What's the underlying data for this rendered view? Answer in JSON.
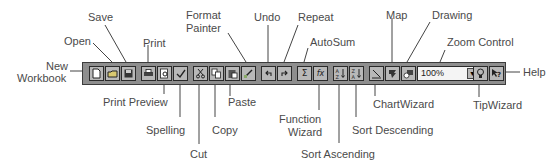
{
  "diagram": {
    "zoom_control": {
      "value": "100%"
    },
    "callouts": {
      "new_workbook": [
        "New",
        "Workbook"
      ],
      "open": "Open",
      "save": "Save",
      "print": "Print",
      "print_preview": "Print Preview",
      "spelling": "Spelling",
      "cut": "Cut",
      "copy": "Copy",
      "paste": "Paste",
      "format_painter": [
        "Format",
        "Painter"
      ],
      "undo": "Undo",
      "repeat": "Repeat",
      "autosum": "AutoSum",
      "function_wizard": [
        "Function",
        "Wizard"
      ],
      "sort_ascending": "Sort Ascending",
      "sort_descending": "Sort Descending",
      "chartwizard": "ChartWizard",
      "map": "Map",
      "drawing": "Drawing",
      "zoom_control": "Zoom Control",
      "tipwizard": "TipWizard",
      "help": "Help"
    },
    "buttons": [
      {
        "id": "new-workbook",
        "glyph": "new-document-icon"
      },
      {
        "id": "open",
        "glyph": "folder-icon"
      },
      {
        "id": "save",
        "glyph": "floppy-disk-icon"
      },
      {
        "id": "print",
        "glyph": "printer-icon"
      },
      {
        "id": "print-preview",
        "glyph": "magnifier-page-icon"
      },
      {
        "id": "spelling",
        "glyph": "abc-check-icon"
      },
      {
        "id": "cut",
        "glyph": "scissors-icon"
      },
      {
        "id": "copy",
        "glyph": "copy-pages-icon"
      },
      {
        "id": "paste",
        "glyph": "clipboard-icon"
      },
      {
        "id": "format-painter",
        "glyph": "paintbrush-icon"
      },
      {
        "id": "undo",
        "glyph": "undo-arrow-icon"
      },
      {
        "id": "repeat",
        "glyph": "redo-arrow-icon"
      },
      {
        "id": "autosum",
        "glyph": "sigma-icon"
      },
      {
        "id": "function-wizard",
        "glyph": "fx-icon"
      },
      {
        "id": "sort-ascending",
        "glyph": "sort-az-icon"
      },
      {
        "id": "sort-descending",
        "glyph": "sort-za-icon"
      },
      {
        "id": "chartwizard",
        "glyph": "chart-wand-icon"
      },
      {
        "id": "map",
        "glyph": "globe-map-icon"
      },
      {
        "id": "drawing",
        "glyph": "shapes-icon"
      },
      {
        "id": "tipwizard",
        "glyph": "lightbulb-icon"
      },
      {
        "id": "help",
        "glyph": "pointer-question-icon"
      }
    ],
    "colors": {
      "toolbar_bg": "#8e8e8e",
      "button_face": "#b8b8b8",
      "label_text": "#4a4a4a",
      "leader_line": "#444444"
    }
  }
}
